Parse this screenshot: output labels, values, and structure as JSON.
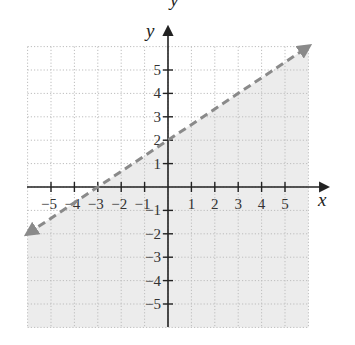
{
  "chart_data": {
    "type": "line",
    "title": "",
    "xlabel": "x",
    "ylabel": "y",
    "top_cropped_label": "y",
    "xlim": [
      -6,
      6
    ],
    "ylim": [
      -6,
      6
    ],
    "grid": true,
    "grid_style": "dotted",
    "x_ticks": [
      -5,
      -4,
      -3,
      -2,
      -1,
      1,
      2,
      3,
      4,
      5
    ],
    "y_ticks": [
      -5,
      -4,
      -3,
      -2,
      -1,
      1,
      2,
      3,
      4,
      5
    ],
    "x_tick_labels": [
      "−5",
      "−4",
      "−3",
      "−2",
      "−1",
      "1",
      "2",
      "3",
      "4",
      "5"
    ],
    "y_tick_labels": [
      "−5",
      "−4",
      "−3",
      "−2",
      "−1",
      "1",
      "2",
      "3",
      "4",
      "5"
    ],
    "series": [
      {
        "name": "boundary line",
        "equation": "y = (2/3)x + 2",
        "style": "dashed",
        "arrows": "both",
        "x": [
          -6,
          -3,
          0,
          3,
          6
        ],
        "y": [
          -2,
          0,
          2,
          4,
          6
        ]
      }
    ],
    "shaded_region": {
      "inequality": "y < (2/3)x + 2",
      "side": "below",
      "color": "#ececec"
    },
    "intercepts": {
      "x_intercept": -3,
      "y_intercept": 2
    },
    "colors": {
      "line": "#8a8a8a",
      "axis": "#222222",
      "grid": "#bdbdbd",
      "shade": "#ececec"
    }
  }
}
